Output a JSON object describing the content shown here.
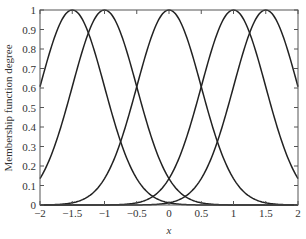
{
  "chart_data": {
    "type": "line",
    "title": "",
    "xlabel": "x",
    "ylabel": "Membership function degree",
    "xlim": [
      -2,
      2
    ],
    "ylim": [
      0,
      1
    ],
    "x_ticks": [
      "-2",
      "-1.5",
      "-1",
      "-0.5",
      "0",
      "0.5",
      "1",
      "1.5",
      "2"
    ],
    "y_ticks": [
      "0",
      "0.1",
      "0.2",
      "0.3",
      "0.4",
      "0.5",
      "0.6",
      "0.7",
      "0.8",
      "0.9",
      "1"
    ],
    "grid": false,
    "legend": null,
    "series": [
      {
        "name": "MF1",
        "shape": "gaussian",
        "center": -1.5,
        "sigma": 0.5
      },
      {
        "name": "MF2",
        "shape": "gaussian",
        "center": -1.0,
        "sigma": 0.5
      },
      {
        "name": "MF3",
        "shape": "gaussian",
        "center": 0.0,
        "sigma": 0.5
      },
      {
        "name": "MF4",
        "shape": "gaussian",
        "center": 1.0,
        "sigma": 0.5
      },
      {
        "name": "MF5",
        "shape": "gaussian",
        "center": 1.5,
        "sigma": 0.5
      }
    ],
    "line_color": "#222222"
  }
}
